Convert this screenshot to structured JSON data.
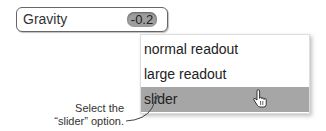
{
  "field": {
    "label": "Gravity",
    "value": "-0.2"
  },
  "menu": {
    "items": [
      {
        "label": "normal readout",
        "selected": false
      },
      {
        "label": "large readout",
        "selected": false
      },
      {
        "label": "slider",
        "selected": true
      }
    ]
  },
  "annotation": {
    "line1": "Select the",
    "line2": "“slider” option."
  },
  "colors": {
    "highlight": "#a6a6a6",
    "value_pill": "#9e9e9e"
  }
}
